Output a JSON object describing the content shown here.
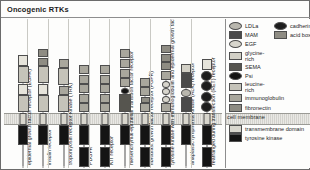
{
  "figure": {
    "title": "Oncogenic RTKs",
    "membrane_label": "cell membrane"
  },
  "receptors": [
    {
      "id": "egfr",
      "label": "epidermal growth factor receptor (EGFR)",
      "ecto": [
        "leucine-rich",
        "cysteine-rich",
        "leucine-rich",
        "cysteine-rich"
      ],
      "intra": [
        "tyrosine kinase"
      ]
    },
    {
      "id": "insulin",
      "label": "insulin receptor",
      "ecto": [
        "leucine-rich",
        "cysteine-rich",
        "leucine-rich",
        "fibronectin",
        "fibronectin"
      ],
      "intra": [
        "tyrosine kinase"
      ]
    },
    {
      "id": "trk",
      "label": "tropomyosin receptor kinase (TRK)",
      "ecto": [
        "leucine-rich",
        "immunoglobulin",
        "leucine-rich",
        "immunoglobulin"
      ],
      "intra": [
        "tyrosine kinase"
      ]
    },
    {
      "id": "pdgfr",
      "label": "PDGFR",
      "ecto": [
        "immunoglobulin",
        "immunoglobulin",
        "immunoglobulin",
        "immunoglobulin",
        "immunoglobulin"
      ],
      "intra": [
        "tyrosine kinase",
        "tyrosine kinase"
      ]
    },
    {
      "id": "kit",
      "label": "KIT receptor",
      "ecto": [
        "immunoglobulin",
        "immunoglobulin",
        "immunoglobulin",
        "immunoglobulin",
        "immunoglobulin"
      ],
      "intra": [
        "tyrosine kinase",
        "tyrosine kinase"
      ]
    },
    {
      "id": "met",
      "label": "mesenchymal-epithelial transition factor receptor",
      "ecto": [
        "SEMA",
        "Psi",
        "immunoglobulin",
        "immunoglobulin",
        "immunoglobulin",
        "immunoglobulin"
      ],
      "intra": [
        "tyrosine kinase"
      ]
    },
    {
      "id": "fgfr",
      "label": "fibroblast growth factor receptor (FGFR)",
      "ecto": [
        "immunoglobulin",
        "acid box",
        "immunoglobulin",
        "immunoglobulin"
      ],
      "intra": [
        "tyrosine kinase",
        "tyrosine kinase"
      ]
    },
    {
      "id": "tie",
      "label": "tyrosine kinase with immunoglobulin and epidermal growth factor homology domains (TIE)",
      "ecto": [
        "immunoglobulin",
        "EGF",
        "EGF",
        "EGF",
        "immunoglobulin",
        "fibronectin",
        "fibronectin",
        "fibronectin"
      ],
      "intra": [
        "tyrosine kinase",
        "tyrosine kinase"
      ]
    },
    {
      "id": "alk",
      "label": "anaplastic lymphoma kinase (ALK) receptor",
      "ecto": [
        "MAM",
        "LDLa",
        "MAM",
        "glycine-rich"
      ],
      "intra": [
        "tyrosine kinase"
      ]
    },
    {
      "id": "ret",
      "label": "rearranged during transfection (RET) receptor",
      "ecto": [
        "cadherin",
        "cadherin",
        "cadherin",
        "cadherin",
        "cysteine-rich"
      ],
      "intra": [
        "tyrosine kinase",
        "tyrosine kinase"
      ]
    }
  ],
  "legend": {
    "column_one": [
      {
        "name": "LDLa",
        "shape": "ellipse",
        "color": "#b9b7ae"
      },
      {
        "name": "MAM",
        "shape": "rect",
        "color": "#4a4a4a"
      },
      {
        "name": "EGF",
        "shape": "ellipse",
        "color": "#d8d6cd"
      },
      {
        "name": "glycine-rich",
        "shape": "rect",
        "color": "#d2d0c6"
      },
      {
        "name": "SEMA",
        "shape": "rect",
        "color": "#56554f"
      },
      {
        "name": "Psi",
        "shape": "ellipse",
        "color": "#141414"
      },
      {
        "name": "leucine-rich",
        "shape": "rect",
        "color": "#c5c3b9"
      },
      {
        "name": "immunoglobulin",
        "shape": "rect",
        "color": "#a9a79d"
      },
      {
        "name": "fibronectin",
        "shape": "rect",
        "color": "#8e8c83"
      },
      {
        "name": "cysteine-rich",
        "shape": "rect",
        "color": "#e6e4db"
      },
      {
        "name": "",
        "shape": "rect",
        "color": "#6e6c64"
      }
    ],
    "column_two": [
      {
        "name": "cadherin",
        "shape": "ellipse",
        "color": "#1d1d1d"
      },
      {
        "name": "acid box",
        "shape": "rect",
        "color": "#8e8c83"
      }
    ],
    "below_membrane": [
      {
        "name": "transmembrane domain",
        "shape": "rect",
        "color": "#d8d6cd"
      },
      {
        "name": "tyrosine kinase",
        "shape": "rect",
        "color": "#141414"
      }
    ]
  }
}
